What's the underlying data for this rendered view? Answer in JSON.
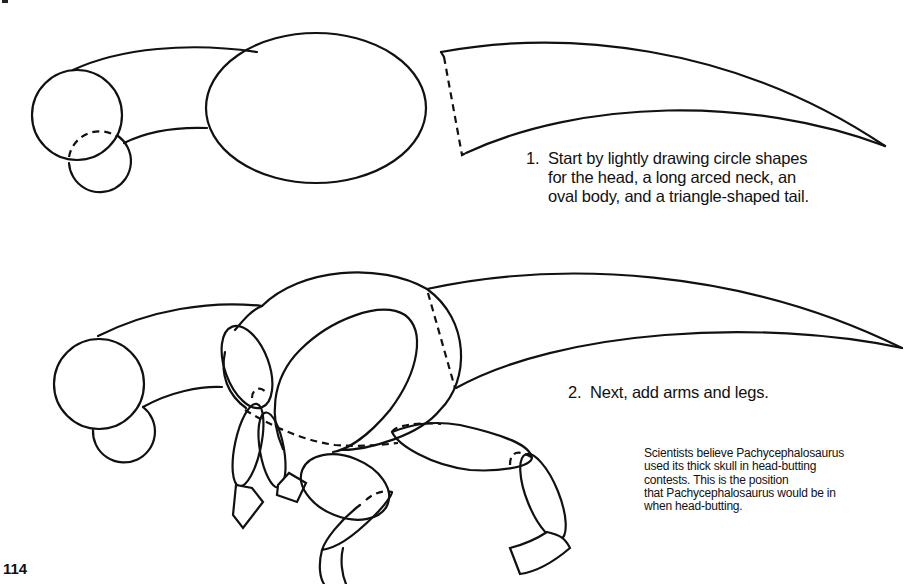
{
  "page": {
    "page_number": "114",
    "subject": "Pachycephalosaurus"
  },
  "steps": [
    {
      "number": "1.",
      "text": "Start by lightly drawing circle shapes\nfor the head, a long arced neck, an\noval body, and a triangle-shaped tail."
    },
    {
      "number": "2.",
      "text": "Next, add arms and legs."
    }
  ],
  "fact_box": {
    "text": "Scientists believe Pachycephalosaurus\nused its thick skull in head-butting\ncontests. This is the position\nthat Pachycephalosaurus would be in\nwhen head-butting."
  },
  "illustrations": [
    {
      "id": "step-1-drawing",
      "shapes": [
        "head-circle",
        "snout-circle",
        "neck-arc",
        "body-oval",
        "tail-triangle"
      ]
    },
    {
      "id": "step-2-drawing",
      "shapes": [
        "head-circle",
        "snout-circle",
        "neck-arc",
        "body-oval",
        "tail-triangle",
        "arm-shoulder",
        "forearm-left",
        "forearm-right",
        "hands",
        "thigh",
        "lower-leg",
        "foot",
        "back-thigh",
        "back-shin",
        "back-foot"
      ]
    }
  ]
}
